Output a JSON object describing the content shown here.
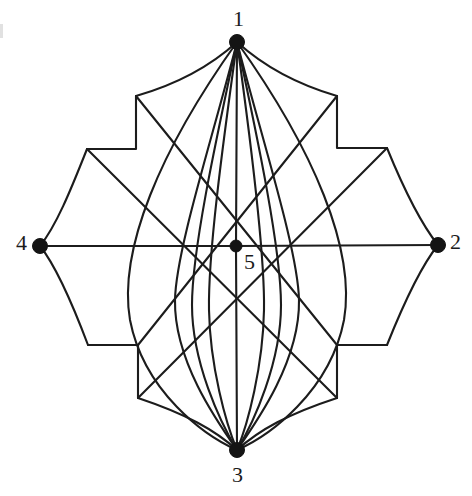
{
  "figure": {
    "background_color": "#ffffff",
    "stroke_color": "#1c1c1c",
    "vertex_color": "#141414",
    "width": 472,
    "height": 496
  },
  "vertices": [
    {
      "id": "1",
      "label": "1",
      "x": 237,
      "y": 42,
      "label_x": 233,
      "label_y": 8,
      "dot_radius": 7.5
    },
    {
      "id": "2",
      "label": "2",
      "x": 438,
      "y": 245,
      "label_x": 450,
      "label_y": 231,
      "dot_radius": 7.5
    },
    {
      "id": "3",
      "label": "3",
      "x": 237,
      "y": 450,
      "label_x": 232,
      "label_y": 464,
      "dot_radius": 7.5
    },
    {
      "id": "4",
      "label": "4",
      "x": 40,
      "y": 246,
      "label_x": 16,
      "label_y": 232,
      "dot_radius": 7.5
    },
    {
      "id": "5",
      "label": "5",
      "x": 236,
      "y": 246,
      "label_x": 244,
      "label_y": 251,
      "dot_radius": 6.0
    }
  ],
  "corners": {
    "top_left_outer": {
      "x": 136,
      "y": 96
    },
    "top_right_outer": {
      "x": 337,
      "y": 96
    },
    "left_top_outer": {
      "x": 87,
      "y": 149
    },
    "right_top_outer": {
      "x": 387,
      "y": 148
    },
    "left_bottom_outer": {
      "x": 88,
      "y": 345
    },
    "right_bottom_outer": {
      "x": 387,
      "y": 345
    },
    "bottom_left_outer": {
      "x": 138,
      "y": 398
    },
    "bottom_right_outer": {
      "x": 337,
      "y": 398
    }
  },
  "edges": [
    {
      "name": "edge-1-5-vertical",
      "from": "1",
      "to": "5",
      "kind": "straight"
    },
    {
      "name": "edge-5-3-vertical",
      "from": "5",
      "to": "3",
      "kind": "straight"
    },
    {
      "name": "edge-4-5-horizontal",
      "from": "4",
      "to": "5",
      "kind": "straight"
    },
    {
      "name": "edge-5-2-horizontal",
      "from": "5",
      "to": "2",
      "kind": "straight"
    },
    {
      "name": "edge-1-2-arc-upper-right",
      "from": "1",
      "to": "2",
      "kind": "arc"
    },
    {
      "name": "edge-1-4-arc-upper-left",
      "from": "1",
      "to": "4",
      "kind": "arc"
    },
    {
      "name": "edge-3-2-arc-lower-right",
      "from": "3",
      "to": "2",
      "kind": "arc"
    },
    {
      "name": "edge-3-4-arc-lower-left",
      "from": "3",
      "to": "4",
      "kind": "arc"
    },
    {
      "name": "edge-1-3-left-outer",
      "from": "1",
      "to": "3",
      "kind": "polyline"
    },
    {
      "name": "edge-1-3-left-inner",
      "from": "1",
      "to": "3",
      "kind": "polyline"
    },
    {
      "name": "edge-1-3-right-outer",
      "from": "1",
      "to": "3",
      "kind": "polyline"
    },
    {
      "name": "edge-1-3-right-inner",
      "from": "1",
      "to": "3",
      "kind": "polyline"
    },
    {
      "name": "edge-1-3-far-left",
      "from": "1",
      "to": "3",
      "kind": "polyline"
    },
    {
      "name": "edge-1-3-far-right",
      "from": "1",
      "to": "3",
      "kind": "polyline"
    }
  ],
  "counts": {
    "vertices": 5,
    "labels": [
      "1",
      "2",
      "3",
      "4",
      "5"
    ]
  }
}
